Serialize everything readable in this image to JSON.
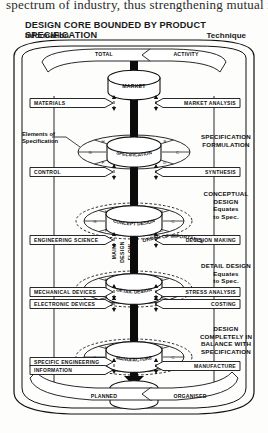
{
  "page": {
    "running_text": "spectrum of industry, thus strengthening mutual inte",
    "title": "DESIGN CORE BOUNDED BY PRODUCT SPECIFICATION",
    "left_heading": "Information",
    "right_heading": "Technique"
  },
  "top_banners": {
    "left": "TOTAL",
    "right": "ACTIVITY"
  },
  "bottom_banners": {
    "left": "PLANNED",
    "right": "ORGANISED"
  },
  "stages": [
    {
      "id": "market",
      "label": "MARKET",
      "curved": false
    },
    {
      "id": "specification",
      "label": "SPECIFICATION",
      "curved": true
    },
    {
      "id": "concept",
      "label": "CONCEPT DESIGN",
      "curved": true
    },
    {
      "id": "detail",
      "label": "DETAIL DESIGN",
      "curved": true
    },
    {
      "id": "manufacture",
      "label": "MANUFACTURE",
      "curved": true
    },
    {
      "id": "sales",
      "label": "SALES",
      "curved": false
    }
  ],
  "left_inputs": [
    {
      "label": "MATERIALS",
      "y": 103
    },
    {
      "label": "CONTROL",
      "y": 172
    },
    {
      "label": "ENGINEERING SCIENCE",
      "y": 240
    },
    {
      "label": "MECHANICAL DEVICES",
      "y": 292
    },
    {
      "label": "ELECTRONIC DEVICES",
      "y": 304
    },
    {
      "label": "SPECIFIC ENGINEERING",
      "y": 362
    },
    {
      "label": "INFORMATION",
      "y": 370
    }
  ],
  "right_inputs": [
    {
      "label": "MARKET ANALYSIS",
      "y": 103
    },
    {
      "label": "SYNTHESIS",
      "y": 172
    },
    {
      "label": "DECISION MAKING",
      "y": 240
    },
    {
      "label": "STRESS ANALYSIS",
      "y": 292
    },
    {
      "label": "COSTING",
      "y": 304
    },
    {
      "label": "MANUFACTURE",
      "y": 366
    }
  ],
  "right_notes": [
    {
      "id": "spec-form",
      "lines": [
        "SPECIFICATION",
        "FORMULATION"
      ]
    },
    {
      "id": "concept-note",
      "lines": [
        "CONCEPTUAL",
        "DESIGN",
        "Equates",
        "to Spec."
      ]
    },
    {
      "id": "detail-note",
      "lines": [
        "DETAIL DESIGN",
        "Equates",
        "to Spec."
      ]
    },
    {
      "id": "manufacture-note",
      "lines": [
        "DESIGN",
        "COMPLETELY IN",
        "BALANCE WITH",
        "SPECIFICATION"
      ]
    }
  ],
  "left_notes": [
    {
      "id": "elements-of-spec",
      "lines": [
        "Elements of",
        "Specification"
      ]
    }
  ],
  "flow_labels": {
    "main_design_flow": [
      "MAIN",
      "DESIGN",
      "FLOW"
    ],
    "order_of_importance": "ORDER OF IMPORTANCE"
  },
  "node_letters": [
    "A",
    "B",
    "C",
    "D",
    "E",
    "F",
    "G",
    "H"
  ],
  "colors": {
    "ink": "#111111",
    "paper": "#fdfdfc",
    "arrow": "#0b0b0b",
    "band_fill": "#ffffff",
    "highlight": "#bdbdbd"
  }
}
